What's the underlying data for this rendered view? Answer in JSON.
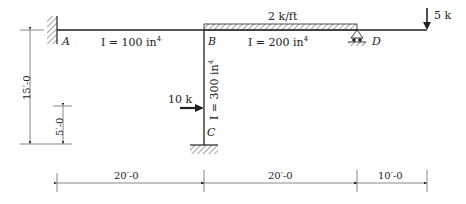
{
  "diagram": {
    "type": "structural frame",
    "joints": {
      "A": {
        "label": "A",
        "support": "fixed"
      },
      "B": {
        "label": "B",
        "support": "rigid joint"
      },
      "C": {
        "label": "C",
        "support": "fixed"
      },
      "D": {
        "label": "D",
        "support": "roller"
      }
    },
    "members": {
      "AB": {
        "inertia_label": "I = 100 in",
        "exp": "4"
      },
      "BD": {
        "inertia_label": "I = 200 in",
        "exp": "4"
      },
      "BC": {
        "inertia_label": "I = 300 in",
        "exp": "4"
      }
    },
    "loads": {
      "distributed": {
        "label": "2 k/ft",
        "span": "B to D"
      },
      "point_tip": {
        "label": "5 k",
        "direction": "down"
      },
      "point_column": {
        "label": "10 k",
        "direction": "right"
      }
    },
    "dimensions": {
      "horizontal": [
        "20′-0",
        "20′-0",
        "10′-0"
      ],
      "vertical_total": "15′-0",
      "vertical_load": "5′-0"
    }
  }
}
